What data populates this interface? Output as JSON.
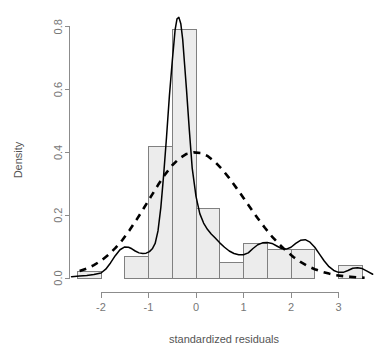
{
  "chart_data": {
    "type": "bar",
    "title": "",
    "subtitle": "",
    "xlabel": "standardized residuals",
    "ylabel": "Density",
    "xlim": [
      -2.62,
      3.72
    ],
    "ylim": [
      0.0,
      0.84
    ],
    "grid": false,
    "legend_position": "none",
    "x_ticks": [
      -2,
      -1,
      0,
      1,
      2,
      3
    ],
    "x_tick_labels": [
      "-2",
      "-1",
      "0",
      "1",
      "2",
      "3"
    ],
    "y_ticks": [
      0.0,
      0.2,
      0.4,
      0.6,
      0.8
    ],
    "y_tick_labels": [
      "0.0",
      "0.2",
      "0.4",
      "0.6",
      "0.8"
    ],
    "bin_width": 0.5,
    "bin_edges": [
      -2.5,
      -2.0,
      -1.5,
      -1.0,
      -0.5,
      0.0,
      0.5,
      1.0,
      1.5,
      2.0,
      2.5,
      3.0,
      3.5
    ],
    "categories": [
      "-2.5..-2.0",
      "-2.0..-1.5",
      "-1.5..-1.0",
      "-1.0..-0.5",
      "-0.5..0.0",
      "0.0..0.5",
      "0.5..1.0",
      "1.0..1.5",
      "1.5..2.0",
      "2.0..2.5",
      "2.5..3.0",
      "3.0..3.5"
    ],
    "values": [
      0.02,
      0.0,
      0.07,
      0.42,
      0.79,
      0.22,
      0.05,
      0.11,
      0.09,
      0.09,
      0.0,
      0.04
    ],
    "bar_fill_color": "#ececec",
    "bar_border_color": "#808080",
    "series": [
      {
        "name": "kernel density estimate",
        "style": "solid",
        "color": "#000000",
        "x": [
          -2.62,
          -2.45,
          -2.3,
          -2.15,
          -2.0,
          -1.9,
          -1.8,
          -1.7,
          -1.6,
          -1.5,
          -1.42,
          -1.35,
          -1.28,
          -1.2,
          -1.12,
          -1.05,
          -0.98,
          -0.92,
          -0.86,
          -0.8,
          -0.74,
          -0.68,
          -0.62,
          -0.56,
          -0.5,
          -0.44,
          -0.4,
          -0.36,
          -0.32,
          -0.28,
          -0.24,
          -0.2,
          -0.14,
          -0.08,
          0.0,
          0.08,
          0.16,
          0.24,
          0.32,
          0.4,
          0.5,
          0.6,
          0.7,
          0.8,
          0.9,
          1.0,
          1.1,
          1.2,
          1.3,
          1.4,
          1.5,
          1.6,
          1.7,
          1.8,
          1.9,
          2.0,
          2.1,
          2.2,
          2.3,
          2.4,
          2.5,
          2.6,
          2.7,
          2.8,
          2.9,
          3.0,
          3.1,
          3.2,
          3.3,
          3.4,
          3.5,
          3.6,
          3.72
        ],
        "y": [
          0.004,
          0.006,
          0.008,
          0.011,
          0.016,
          0.028,
          0.048,
          0.071,
          0.09,
          0.099,
          0.098,
          0.093,
          0.086,
          0.08,
          0.078,
          0.079,
          0.084,
          0.093,
          0.11,
          0.15,
          0.225,
          0.33,
          0.45,
          0.58,
          0.69,
          0.79,
          0.825,
          0.83,
          0.81,
          0.76,
          0.68,
          0.6,
          0.47,
          0.35,
          0.26,
          0.205,
          0.175,
          0.155,
          0.14,
          0.128,
          0.112,
          0.098,
          0.086,
          0.078,
          0.074,
          0.074,
          0.08,
          0.094,
          0.106,
          0.112,
          0.113,
          0.11,
          0.102,
          0.094,
          0.092,
          0.098,
          0.11,
          0.12,
          0.122,
          0.114,
          0.098,
          0.076,
          0.054,
          0.036,
          0.024,
          0.018,
          0.018,
          0.024,
          0.031,
          0.033,
          0.03,
          0.022,
          0.012
        ]
      },
      {
        "name": "normal reference curve",
        "style": "dashed",
        "color": "#000000",
        "x": [
          -2.45,
          -2.3,
          -2.15,
          -2.0,
          -1.85,
          -1.7,
          -1.55,
          -1.4,
          -1.25,
          -1.1,
          -0.95,
          -0.8,
          -0.65,
          -0.5,
          -0.35,
          -0.2,
          -0.05,
          0.1,
          0.25,
          0.4,
          0.55,
          0.7,
          0.85,
          1.0,
          1.15,
          1.3,
          1.45,
          1.6,
          1.75,
          1.9,
          2.05,
          2.2,
          2.35,
          2.5,
          2.65,
          2.8,
          2.95,
          3.1,
          3.25,
          3.4,
          3.55
        ],
        "y": [
          0.022,
          0.03,
          0.041,
          0.055,
          0.073,
          0.095,
          0.121,
          0.152,
          0.186,
          0.222,
          0.259,
          0.296,
          0.33,
          0.359,
          0.381,
          0.395,
          0.4,
          0.398,
          0.388,
          0.37,
          0.346,
          0.318,
          0.287,
          0.255,
          0.222,
          0.19,
          0.16,
          0.132,
          0.108,
          0.086,
          0.067,
          0.051,
          0.038,
          0.028,
          0.02,
          0.014,
          0.009,
          0.006,
          0.004,
          0.002,
          0.001
        ]
      }
    ]
  },
  "axes": {
    "x_title": "standardized residuals",
    "y_title": "Density"
  }
}
